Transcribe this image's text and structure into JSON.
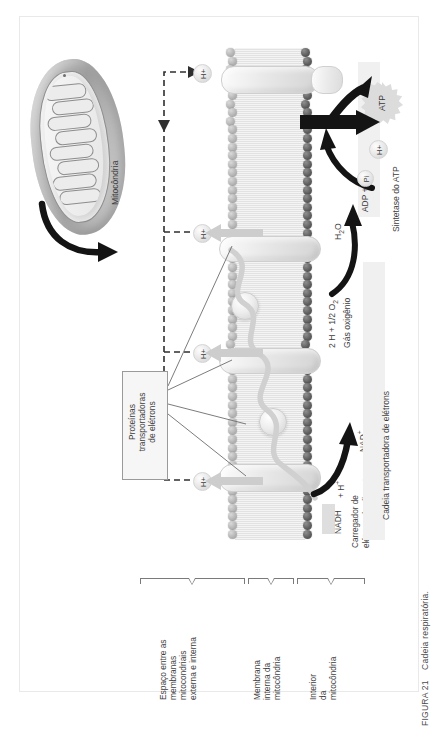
{
  "figure": {
    "caption_number": "FIGURA 21",
    "caption_text": "Cadeia respiratória.",
    "organelle_label": "Mitocôndria"
  },
  "proton_markers": [
    {
      "label": "H+",
      "position": "top"
    },
    {
      "label": "H+",
      "position": "upper-middle"
    },
    {
      "label": "H+",
      "position": "lower-middle"
    },
    {
      "label": "H+",
      "position": "bottom"
    }
  ],
  "protein_box": {
    "line1": "Proteínas",
    "line2": "transportadoras",
    "line3": "de elétrons"
  },
  "atp_synthase": {
    "product_label": "ATP",
    "proton_label": "H+",
    "substrate_label": "ADP +",
    "substrate_pi": "Pi",
    "section_label": "Sintetase do ATP"
  },
  "oxygen_step": {
    "reactants": "2 H + 1/2 O2",
    "reactants_sub": "Gás oxigênio",
    "product": "H2O"
  },
  "nadh_step": {
    "donor": "NADH",
    "donor_rest": "+ H+",
    "acceptor": "NAD+",
    "caption_line1": "Carregador de",
    "caption_line2": "elétrons do alimento"
  },
  "chain_section": {
    "label": "Cadeia transportadora de elétrons"
  },
  "compartments": [
    {
      "id": "intermembrane",
      "lines": [
        "Espaço entre as",
        "membranas",
        "mitocondriais",
        "externa e interna"
      ]
    },
    {
      "id": "inner-membrane",
      "lines": [
        "Membrana",
        "interna da",
        "mitocôndria"
      ]
    },
    {
      "id": "matrix",
      "lines": [
        "Interior",
        "da",
        "mitocôndria"
      ]
    }
  ],
  "colors": {
    "text": "#3d3d3d",
    "rule": "#7a7a7a",
    "band": "#f0f0f0",
    "membrane_head": "#5d5d5d",
    "arrow_black": "#111111",
    "arrow_grey": "#c9c9c9"
  }
}
